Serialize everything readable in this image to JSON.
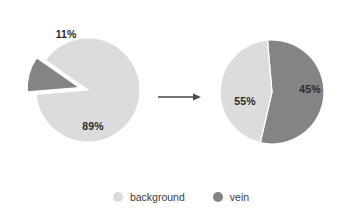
{
  "figure": {
    "background_color": "#ffffff",
    "arrow": {
      "name": "transition-arrow",
      "direction": "right",
      "color": "#4a4a4a",
      "x1": 158,
      "y1": 97,
      "x2": 200,
      "y2": 97
    }
  },
  "colors": {
    "background_slice": "#dcdcdc",
    "vein_slice": "#848484",
    "label_text": "#2b2b2b",
    "legend_text": "#3a3a3a",
    "separator": "#ffffff"
  },
  "legend": {
    "position": "bottom-center",
    "items": [
      {
        "label": "background",
        "color": "#dcdcdc"
      },
      {
        "label": "vein",
        "color": "#848484"
      }
    ]
  },
  "chart_data": [
    {
      "type": "pie",
      "name": "before-pie",
      "title": "",
      "categories": [
        "background",
        "vein"
      ],
      "values": [
        89,
        11
      ],
      "labels": [
        "89%",
        "11%"
      ],
      "colors": [
        "#dcdcdc",
        "#848484"
      ],
      "exploded": [
        false,
        true
      ],
      "units": "%",
      "center": {
        "cx": 88,
        "cy": 90
      },
      "radius": 52,
      "start_angle_deg": -55,
      "legend": "bottom"
    },
    {
      "type": "pie",
      "name": "after-pie",
      "title": "",
      "categories": [
        "vein",
        "background"
      ],
      "values": [
        55,
        45
      ],
      "labels": [
        "55%",
        "45%"
      ],
      "colors": [
        "#848484",
        "#dcdcdc"
      ],
      "exploded": [
        false,
        false
      ],
      "units": "%",
      "center": {
        "cx": 272,
        "cy": 92
      },
      "radius": 52,
      "start_angle_deg": -5,
      "legend": "bottom"
    }
  ],
  "slice_labels": {
    "before_vein": "11%",
    "before_background": "89%",
    "after_vein": "55%",
    "after_background": "45%"
  }
}
